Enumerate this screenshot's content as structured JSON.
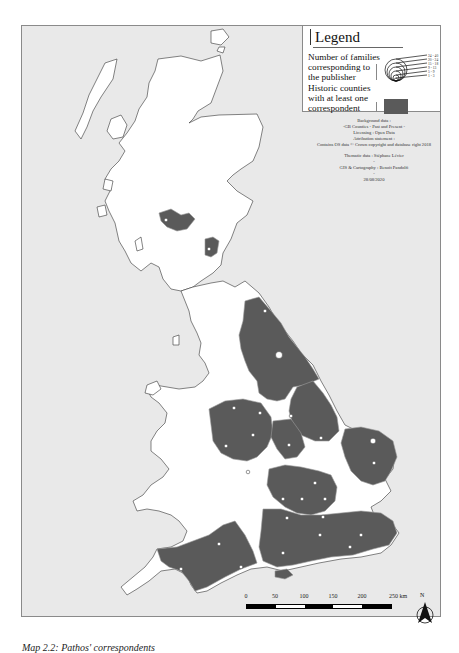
{
  "legend": {
    "title": "Legend",
    "symbol_label": "Number of families corresponding to the publisher",
    "fill_label": "Historic counties with at least one correspondent",
    "classes": [
      "24 - 40",
      "20 - 24",
      "15 - 18",
      "9 - 13",
      "5 - 9",
      "1 - 3"
    ],
    "fill_color": "#5a5a5a"
  },
  "credits": {
    "lines": [
      "Background data :",
      "-GB Counties - Past and Present -",
      "Licensing : Open Data",
      "Attribution statement :",
      "Contains OS data © Crown copyright and database right 2018",
      "",
      "Thematic data : Stéphane Lévier",
      "-",
      "GIS & Cartography : Benoit Pandolfi",
      "-",
      "28/08/2020"
    ]
  },
  "scale_bar": {
    "ticks": [
      "0",
      "50",
      "100",
      "150",
      "200",
      "250 km"
    ],
    "unit": "km"
  },
  "north_arrow": {
    "label": "N"
  },
  "caption": "Map 2.2: Pathos' correspondents",
  "colors": {
    "sea": "#e9e9e9",
    "land": "#ffffff",
    "highlighted_county": "#5a5a5a",
    "county_border": "#9a9a9a",
    "marker": "#ffffff"
  },
  "map": {
    "highlighted_counties": [
      "Stirlingshire",
      "Peeblesshire",
      "Durham",
      "Yorkshire",
      "Lincolnshire",
      "Norfolk",
      "Suffolk",
      "Cheshire",
      "Staffordshire",
      "Shropshire",
      "Derbyshire",
      "Nottinghamshire",
      "Leicestershire",
      "Warwickshire",
      "Northamptonshire",
      "Bedfordshire",
      "Buckinghamshire",
      "Hertfordshire",
      "Oxfordshire",
      "Berkshire",
      "Surrey",
      "Kent",
      "Sussex",
      "Hampshire",
      "Isle of Wight",
      "Dorset",
      "Somerset",
      "Devon",
      "Middlesex",
      "Wiltshire"
    ]
  }
}
